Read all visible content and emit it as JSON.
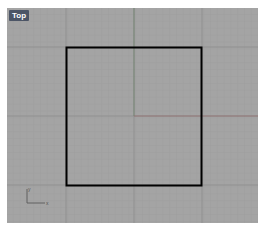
{
  "viewport": {
    "label": "Top",
    "background_color": "#a4a4a4",
    "grid": {
      "minor_spacing_px": 6.8,
      "major_spacing_px": 68,
      "minor_color": "#9c9c9c",
      "major_color": "#8e8e8e"
    },
    "world_axes": {
      "x_axis_color": "#8a6e6e",
      "y_axis_color": "#6e7f6e",
      "origin_px": [
        127,
        108
      ]
    },
    "objects": [
      {
        "type": "rectangle",
        "name": "square-curve",
        "x": 59,
        "y": 39,
        "width": 135,
        "height": 138,
        "stroke": "#000000",
        "stroke_width": 2
      }
    ],
    "axis_indicator": {
      "x_label": "x",
      "y_label": "y"
    }
  }
}
